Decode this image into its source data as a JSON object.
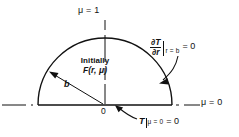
{
  "figure": {
    "type": "technical-diagram",
    "labels": {
      "axis_top": "μ = 1",
      "axis_right": "μ = 0",
      "origin": "0",
      "radius": "b",
      "initial_line1": "Initially",
      "initial_line2": "F(r, μ)",
      "neumann_numerator": "∂T",
      "neumann_denominator": "∂r",
      "neumann_subscript": "r = b",
      "neumann_equals": "= 0",
      "dirichlet_T": "T",
      "dirichlet_subscript": "μ = 0",
      "dirichlet_equals": "= 0"
    },
    "geometry": {
      "center_x": 105,
      "center_y": 105,
      "radius_px": 67,
      "arc_start_deg": 180,
      "arc_end_deg": 0
    },
    "colors": {
      "stroke": "#111111",
      "background": "#ffffff"
    }
  }
}
